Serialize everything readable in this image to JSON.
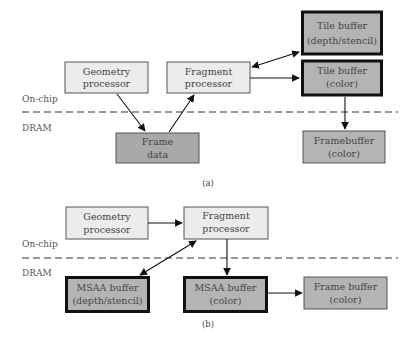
{
  "colors": {
    "processor_fill": "#ececec",
    "memory_fill": "#a9a9a9",
    "buffer_fill": "#b4b4b4",
    "stroke": "#111111",
    "text": "#444444",
    "dashed_line": "#333333"
  },
  "diagram_a": {
    "caption": "(a)",
    "region_labels": {
      "on_chip": "On-chip",
      "dram": "DRAM"
    },
    "nodes": {
      "geometry": {
        "line1": "Geometry",
        "line2": "processor"
      },
      "fragment": {
        "line1": "Fragment",
        "line2": "processor"
      },
      "tile_depth": {
        "line1": "Tile buffer",
        "line2": "(depth/stencil)"
      },
      "tile_color": {
        "line1": "Tile buffer",
        "line2": "(color)"
      },
      "frame_data": {
        "line1": "Frame",
        "line2": "data"
      },
      "framebuffer": {
        "line1": "Framebuffer",
        "line2": "(color)"
      }
    },
    "edges": [
      {
        "from": "geometry",
        "to": "frame_data",
        "type": "arrow"
      },
      {
        "from": "frame_data",
        "to": "fragment",
        "type": "arrow"
      },
      {
        "from": "fragment",
        "to": "tile_depth",
        "type": "bidirectional"
      },
      {
        "from": "fragment",
        "to": "tile_color",
        "type": "arrow"
      },
      {
        "from": "tile_color",
        "to": "framebuffer",
        "type": "arrow"
      }
    ]
  },
  "diagram_b": {
    "caption": "(b)",
    "region_labels": {
      "on_chip": "On-chip",
      "dram": "DRAM"
    },
    "nodes": {
      "geometry": {
        "line1": "Geometry",
        "line2": "processor"
      },
      "fragment": {
        "line1": "Fragment",
        "line2": "processor"
      },
      "msaa_depth": {
        "line1": "MSAA buffer",
        "line2": "(depth/stencil)"
      },
      "msaa_color": {
        "line1": "MSAA buffer",
        "line2": "(color)"
      },
      "frame_buffer": {
        "line1": "Frame buffer",
        "line2": "(color)"
      }
    },
    "edges": [
      {
        "from": "geometry",
        "to": "fragment",
        "type": "arrow"
      },
      {
        "from": "fragment",
        "to": "msaa_depth",
        "type": "bidirectional"
      },
      {
        "from": "fragment",
        "to": "msaa_color",
        "type": "arrow"
      },
      {
        "from": "msaa_color",
        "to": "frame_buffer",
        "type": "arrow"
      }
    ]
  }
}
